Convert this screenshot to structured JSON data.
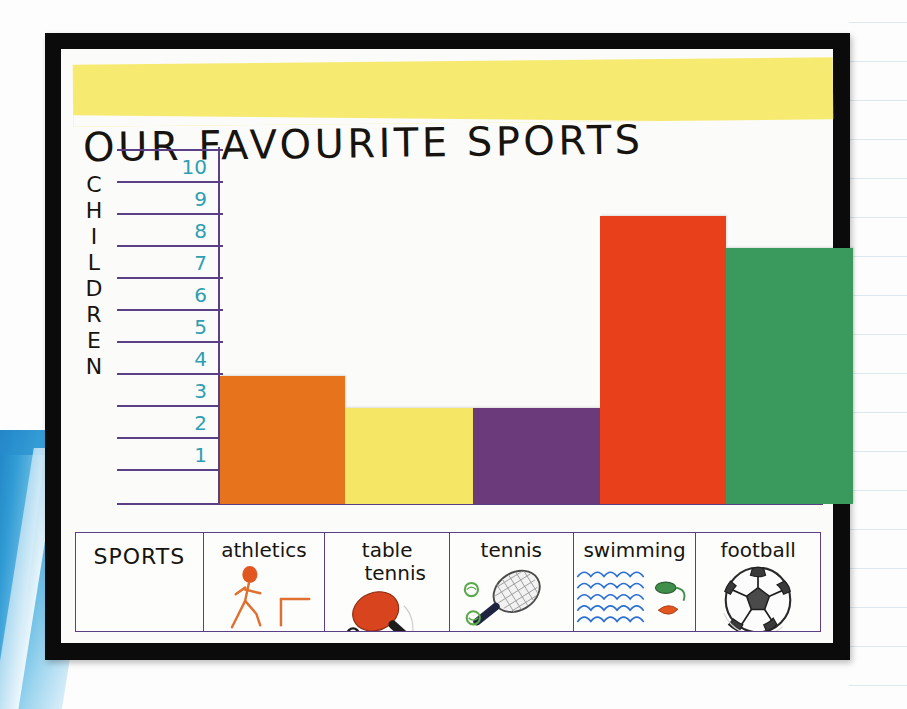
{
  "poster": {
    "title": "OUR FAVOURITE SPORTS",
    "y_axis_label_letters": [
      "C",
      "H",
      "I",
      "L",
      "D",
      "R",
      "E",
      "N"
    ],
    "y_axis_label": "CHILDREN",
    "category_header": "SPORTS",
    "tick_labels": [
      "10",
      "9",
      "8",
      "7",
      "6",
      "5",
      "4",
      "3",
      "2",
      "1"
    ],
    "colors": {
      "banner": "#f7ea70",
      "gridline": "#5a3f86",
      "tick_text": "#2e9fb3",
      "frame": "#0b0b0b",
      "paper": "#fbfbf9"
    }
  },
  "chart_data": {
    "type": "bar",
    "title": "OUR FAVOURITE SPORTS",
    "xlabel": "SPORTS",
    "ylabel": "CHILDREN",
    "ylim": [
      0,
      10
    ],
    "yticks": [
      1,
      2,
      3,
      4,
      5,
      6,
      7,
      8,
      9,
      10
    ],
    "grid": true,
    "legend": "none",
    "categories": [
      "athletics",
      "table tennis",
      "tennis",
      "swimming",
      "football"
    ],
    "values": [
      4,
      3,
      3,
      9,
      8
    ],
    "bar_colors": [
      "#e8731d",
      "#f5e665",
      "#6b3a7a",
      "#e8401a",
      "#3a9a5e"
    ],
    "bars": [
      {
        "category": "athletics",
        "label_lines": [
          "athletics"
        ],
        "value": 4,
        "color": "#e8731d",
        "icon": "running-stick-figure-icon"
      },
      {
        "category": "table tennis",
        "label_lines": [
          "table",
          "tennis"
        ],
        "value": 3,
        "color": "#f5e665",
        "icon": "table-tennis-paddle-icon"
      },
      {
        "category": "tennis",
        "label_lines": [
          "tennis"
        ],
        "value": 3,
        "color": "#6b3a7a",
        "icon": "tennis-racket-icon"
      },
      {
        "category": "swimming",
        "label_lines": [
          "swimming"
        ],
        "value": 9,
        "color": "#e8401a",
        "icon": "swimming-waves-icon"
      },
      {
        "category": "football",
        "label_lines": [
          "football"
        ],
        "value": 8,
        "color": "#3a9a5e",
        "icon": "football-ball-icon"
      }
    ]
  }
}
